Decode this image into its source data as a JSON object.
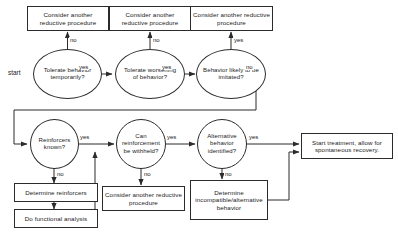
{
  "diagram": {
    "start_label": "start",
    "stroke_color": "#2b2b2b",
    "text_color": "#1a1a1a",
    "background_color": "#ffffff"
  },
  "nodes": {
    "consider_top_1": "Consider another reductive procedure",
    "consider_top_2": "Consider another reductive procedure",
    "consider_top_3": "Consider another reductive procedure",
    "tolerate_behavior": "Tolerate behavior temporarily?",
    "tolerate_worsening": "Tolerate worsening of behavior?",
    "behavior_imitated": "Behavior likely to be imitated?",
    "reinforcers_known": "Reinforcers known?",
    "can_withhold": "Can reinforcement be withheld?",
    "alternative_identified": "Alternative behavior identified?",
    "start_treatment": "Start treatment, allow for spontaneous recovery.",
    "determine_reinforcers": "Determine reinforcers",
    "do_functional_analysis": "Do functional analysis",
    "consider_bottom": "Consider another reductive procedure",
    "determine_incompatible": "Determine incompatible/alternative behavior"
  },
  "edge_labels": {
    "tolerate_no": "no",
    "tolerate_yes": "yes",
    "worsening_no": "no",
    "worsening_yes": "yes",
    "imitated_yes": "yes",
    "imitated_no": "no",
    "reinforcers_yes": "yes",
    "reinforcers_no": "no",
    "withhold_yes": "yes",
    "withhold_no": "no",
    "alternative_yes": "yes",
    "alternative_no": "no"
  }
}
